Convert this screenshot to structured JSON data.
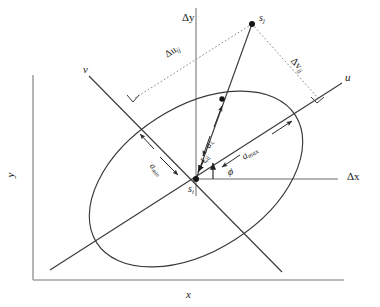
{
  "figure": {
    "type": "geometry-diagram",
    "background_color": "#ffffff",
    "line_color": "#3a3a3a",
    "axis_color": "#9a9a9a",
    "dotted_color": "#7a7a7a"
  },
  "outer_axes": {
    "x_label": "x",
    "y_label": "y"
  },
  "local_axes": {
    "dx_label": "Δx",
    "dy_label": "Δy"
  },
  "principal_axes": {
    "u_label": "u",
    "v_label": "v"
  },
  "points": {
    "origin_site": {
      "label_base": "s",
      "label_sub": "i"
    },
    "target_site": {
      "label_base": "s",
      "label_sub": "j"
    }
  },
  "projections": {
    "du_base": "Δu",
    "du_sub": "ij",
    "dv_base": "Δv",
    "dv_sub": "ij"
  },
  "measures": {
    "a_max_base": "a",
    "a_max_sub": "max",
    "a_min_base": "a",
    "a_min_sub": "min",
    "a_xi_base": "a",
    "a_xi_sub": "ξ",
    "xi_base": "ξ",
    "xi_sub": "ij",
    "angle": "ϕ"
  }
}
